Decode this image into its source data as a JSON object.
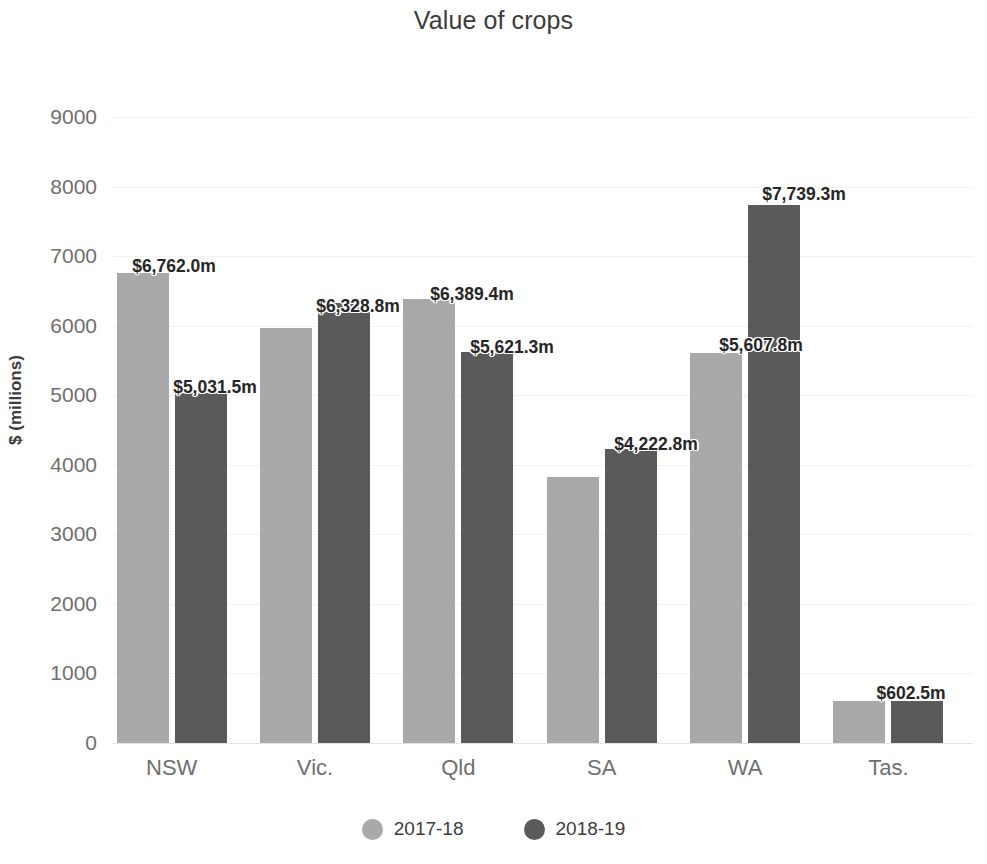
{
  "chart_data": {
    "type": "bar",
    "title": "Value of crops",
    "xlabel": "",
    "ylabel": "$ (millions)",
    "ylim": [
      0,
      9000
    ],
    "yticks": [
      9000,
      8000,
      7000,
      6000,
      5000,
      4000,
      3000,
      2000,
      1000,
      0
    ],
    "ytick_labels": [
      "9000",
      "8000",
      "7000",
      "6000",
      "5000",
      "4000",
      "3000",
      "2000",
      "1000",
      "0"
    ],
    "grid": true,
    "legend_position": "bottom",
    "categories": [
      "NSW",
      "Vic.",
      "Qld",
      "SA",
      "WA",
      "Tas."
    ],
    "series": [
      {
        "name": "2017-18",
        "color": "#a9a9a9",
        "values": [
          6762.0,
          5972.0,
          6389.4,
          3824.0,
          5607.8,
          602.5
        ],
        "labels": [
          "$6,762.0m",
          "",
          "$6,389.4m",
          "",
          "$5,607.8m",
          "$602.5m"
        ]
      },
      {
        "name": "2018-19",
        "color": "#5a5a5a",
        "values": [
          5031.5,
          6328.8,
          5621.3,
          4222.8,
          7739.3,
          602.5
        ],
        "labels": [
          "$5,031.5m",
          "$6,328.8m",
          "$5,621.3m",
          "$4,222.8m",
          "$7,739.3m",
          ""
        ]
      }
    ],
    "data_labels": [
      {
        "text": "$6,762.0m",
        "x": 174,
        "y": 256
      },
      {
        "text": "$5,031.5m",
        "x": 215,
        "y": 377
      },
      {
        "text": "$6,328.8m",
        "x": 358,
        "y": 296
      },
      {
        "text": "$6,389.4m",
        "x": 472,
        "y": 284
      },
      {
        "text": "$5,621.3m",
        "x": 512,
        "y": 337
      },
      {
        "text": "$4,222.8m",
        "x": 656,
        "y": 434
      },
      {
        "text": "$5,607.8m",
        "x": 761,
        "y": 335
      },
      {
        "text": "$7,739.3m",
        "x": 804,
        "y": 184
      },
      {
        "text": "$602.5m",
        "x": 911,
        "y": 683
      }
    ]
  },
  "legend": {
    "items": [
      {
        "label": "2017-18",
        "color": "#a9a9a9"
      },
      {
        "label": "2018-19",
        "color": "#5a5a5a"
      }
    ]
  }
}
